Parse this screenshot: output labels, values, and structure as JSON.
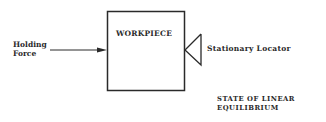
{
  "diagram": {
    "type": "mechanical-force-diagram",
    "labels": {
      "holding_force_line1": "Holding",
      "holding_force_line2": "Force",
      "workpiece": "WORKPIECE",
      "stationary_locator": "Stationary Locator",
      "state_line1": "STATE OF LINEAR",
      "state_line2": "EQUILIBRIUM"
    },
    "nodes": [
      {
        "id": "workpiece",
        "shape": "rectangle",
        "label": "WORKPIECE"
      },
      {
        "id": "locator",
        "shape": "triangle",
        "label": "Stationary Locator"
      }
    ],
    "edges": [
      {
        "from": "holding-force",
        "to": "workpiece",
        "kind": "arrow",
        "label": "Holding Force"
      }
    ],
    "caption": "STATE OF LINEAR EQUILIBRIUM",
    "colors": {
      "stroke": "#2a2a2a",
      "background": "#ffffff"
    }
  }
}
